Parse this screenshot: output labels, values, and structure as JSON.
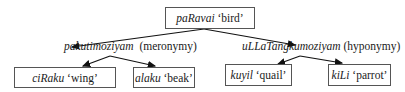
{
  "diagram": {
    "root": {
      "term": "paRavai",
      "gloss": "‘bird’"
    },
    "branches": [
      {
        "term": "pakutimoziyam",
        "relation": "(meronymy)",
        "children": [
          {
            "term": "ciRaku",
            "gloss": "‘wing’"
          },
          {
            "term": "alaku",
            "gloss": "‘beak’"
          }
        ]
      },
      {
        "term": "uLLaTangkumoziyam",
        "relation": "(hyponymy)",
        "children": [
          {
            "term": "kuyil",
            "gloss": "‘quail’"
          },
          {
            "term": "kiLi",
            "gloss": "‘parrot’"
          }
        ]
      }
    ]
  }
}
